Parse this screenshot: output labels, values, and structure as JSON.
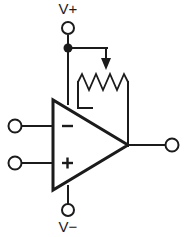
{
  "diagram": {
    "type": "circuit-schematic",
    "canvas": {
      "width": 187,
      "height": 237,
      "background": "#ffffff"
    },
    "stroke_color": "#1b1b1b"
  },
  "labels": {
    "v_plus": "V+",
    "v_minus": "V−",
    "inverting_input": "−",
    "noninverting_input": "+"
  },
  "components": {
    "opamp": {
      "name": "operational-amplifier",
      "shape": "triangle",
      "vertices": [
        [
          53,
          100
        ],
        [
          53,
          190
        ],
        [
          128,
          145
        ]
      ]
    },
    "potentiometer": {
      "name": "potentiometer",
      "shape": "zigzag-resistor-with-wiper",
      "wiper_x": 106,
      "left_lead_x": 78,
      "right_lead_x": 128,
      "body_y": 82
    },
    "power_junction": {
      "name": "junction-dot",
      "x": 68,
      "y": 48
    }
  },
  "terminals": [
    {
      "name": "v-plus-terminal",
      "x": 68,
      "y": 28,
      "label": "V+"
    },
    {
      "name": "v-minus-terminal",
      "x": 68,
      "y": 210,
      "label": "V−"
    },
    {
      "name": "inverting-input-terminal",
      "x": 15,
      "y": 126,
      "label": "−"
    },
    {
      "name": "noninverting-input-terminal",
      "x": 15,
      "y": 163,
      "label": "+"
    },
    {
      "name": "output-terminal",
      "x": 172,
      "y": 145,
      "label": ""
    }
  ]
}
